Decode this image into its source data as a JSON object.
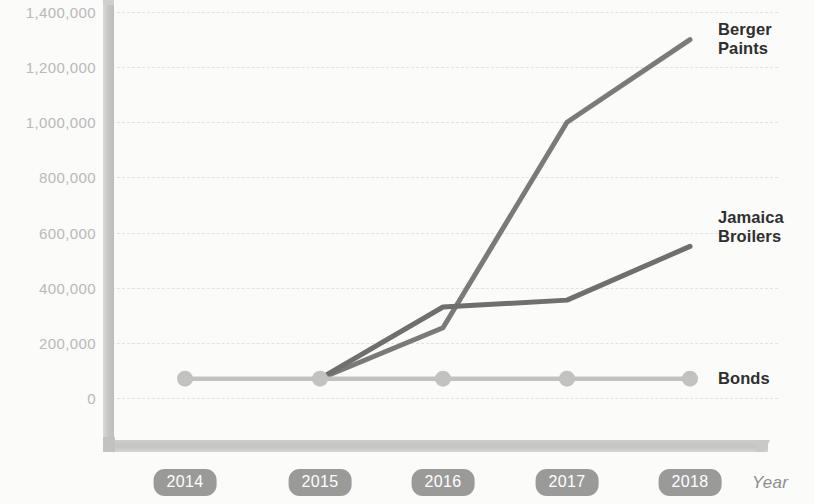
{
  "chart_data": {
    "type": "line",
    "title": "",
    "subtitle": "",
    "xlabel": "Year",
    "ylabel": "",
    "categories": [
      "2014",
      "2015",
      "2016",
      "2017",
      "2018"
    ],
    "x": [
      2014,
      2015,
      2016,
      2017,
      2018
    ],
    "ylim": [
      0,
      1400000
    ],
    "ytick_labels": [
      "1,400,000",
      "1,200,000",
      "1,000,000",
      "800,000",
      "600,000",
      "400,000",
      "200,000",
      "0"
    ],
    "ytick_values": [
      1400000,
      1200000,
      1000000,
      800000,
      600000,
      400000,
      200000,
      0
    ],
    "grid": true,
    "legend_position": "right-inline-labels",
    "series": [
      {
        "name": "Berger Paints",
        "label_lines": "Berger\nPaints",
        "color": "#7a7a78",
        "markers": false,
        "values": [
          null,
          70000,
          255000,
          1000000,
          1300000
        ]
      },
      {
        "name": "Jamaica Broilers",
        "label_lines": "Jamaica\nBroilers",
        "color": "#6f6f6d",
        "markers": false,
        "values": [
          null,
          70000,
          330000,
          355000,
          550000
        ]
      },
      {
        "name": "Bonds",
        "label_lines": "Bonds",
        "color": "#c2c2c0",
        "markers": true,
        "values": [
          70000,
          70000,
          70000,
          70000,
          70000
        ]
      }
    ],
    "annotations": []
  },
  "axis": {
    "x_title": "Year"
  },
  "labels": {
    "berger": "Berger\nPaints",
    "jamaica": "Jamaica\nBroilers",
    "bonds": "Bonds"
  }
}
